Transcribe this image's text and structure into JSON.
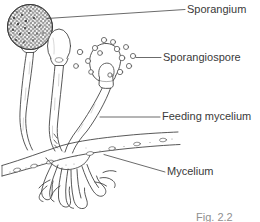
{
  "figure": {
    "caption": "Fig. 2.2",
    "background_color": "#ffffff",
    "ink_color": "#3a3a3a",
    "labels": [
      {
        "id": "sporangium",
        "text": "Sporangium",
        "leader": "diagonal line from spore-head up-right to text"
      },
      {
        "id": "sporangiospore",
        "text": "Sporangiospore",
        "leader": "short horizontal line from spore cluster to text"
      },
      {
        "id": "feeding_mycelium",
        "text": "Feeding mycelium",
        "leader": "horizontal line from stalk base to text"
      },
      {
        "id": "mycelium",
        "text": "Mycelium",
        "leader": "diagonal line from horizontal hypha down-right to text"
      }
    ],
    "parts": {
      "mature_sporangium": "stippled dark spore head at upper left",
      "young_sporangium": "smooth pale oval head, centre",
      "open_sporangium": "burst sporangium with columella, right",
      "released_spores": 15,
      "stalks": 3,
      "horizontal_hypha": "stolon running left to right with oval cells",
      "rhizoids": "branched root-like filaments below the stolon"
    }
  }
}
